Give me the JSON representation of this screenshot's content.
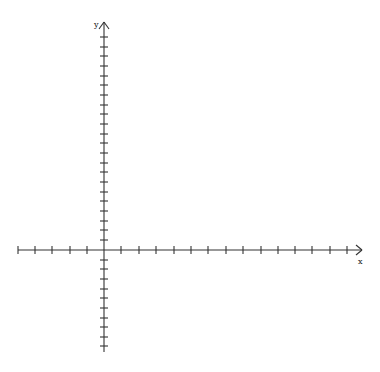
{
  "diagram": {
    "type": "cartesian-axes",
    "axis_color": "#333333",
    "x_axis": {
      "label": "x",
      "y_pos": 250,
      "x_start": 18,
      "x_end": 362,
      "tick_positions": [
        18,
        35,
        52,
        70,
        87,
        121,
        139,
        156,
        174,
        191,
        208,
        226,
        243,
        261,
        278,
        295,
        312,
        330,
        347
      ]
    },
    "y_axis": {
      "label": "y",
      "x_pos": 104,
      "y_top": 22,
      "y_bottom": 352,
      "tick_positions": [
        37,
        47,
        56,
        66,
        76,
        85,
        95,
        105,
        114,
        124,
        134,
        143,
        153,
        163,
        172,
        182,
        192,
        201,
        211,
        221,
        230,
        240,
        260,
        269,
        279,
        289,
        298,
        308,
        318,
        327,
        337,
        346
      ]
    }
  }
}
